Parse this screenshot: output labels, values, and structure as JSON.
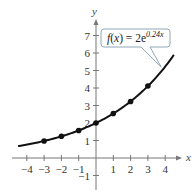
{
  "chart_data": {
    "type": "line",
    "title": "",
    "function_label": "f(x) = 2e^{0.24x}",
    "function_label_parts": {
      "lhs": "f(x) = 2e",
      "exponent": "0.24x"
    },
    "xlabel": "x",
    "ylabel": "y",
    "xlim": [
      -4.5,
      4.8
    ],
    "ylim": [
      -1.5,
      7.8
    ],
    "x_ticks": [
      -4,
      -3,
      -2,
      -1,
      1,
      2,
      3,
      4
    ],
    "y_ticks": [
      -1,
      1,
      2,
      3,
      4,
      5,
      6,
      7
    ],
    "grid": false,
    "series": [
      {
        "name": "f(x) = 2e^(0.24x)",
        "kind": "curve",
        "x_range": [
          -4.5,
          4.5
        ],
        "coefficient": 2,
        "rate": 0.24
      },
      {
        "name": "plotted points",
        "kind": "scatter",
        "x": [
          -3,
          -2,
          -1,
          0,
          1,
          2,
          3
        ],
        "y": [
          0.97,
          1.24,
          1.57,
          2.0,
          2.54,
          3.23,
          4.11
        ]
      }
    ],
    "colors": {
      "curve": "#111111",
      "axes": "#777777",
      "callout_border": "#8fa8b8",
      "callout_fill": "#ffffff"
    }
  }
}
